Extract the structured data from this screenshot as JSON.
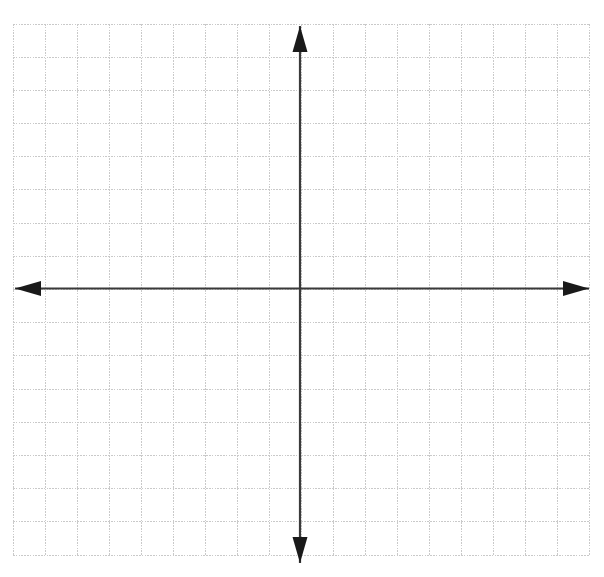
{
  "figure": {
    "name": "blank-cartesian-coordinate-grid",
    "type": "coordinate-plane",
    "background_color": "#ffffff"
  },
  "canvas": {
    "width": 604,
    "height": 577
  },
  "grid": {
    "line_color": "#c9c9c9",
    "line_width": 1,
    "dash_pattern": "1.6 1.2",
    "left": 13,
    "top": 24,
    "right": 590,
    "bottom": 555,
    "columns": 18,
    "rows": 16,
    "cell_width": 32.05,
    "cell_height": 33.19,
    "visible": true
  },
  "axes": {
    "color": "#3a3a3a",
    "line_width": 2.2,
    "origin_x": 300,
    "origin_y": 288.5,
    "x_axis": {
      "name": "x-axis",
      "label": "",
      "start_x": 15,
      "end_x": 589,
      "arrow_both_ends": true
    },
    "y_axis": {
      "name": "y-axis",
      "label": "",
      "start_y": 26,
      "end_y": 563,
      "arrow_both_ends": true
    },
    "tick_labels": [],
    "axis_labels": []
  },
  "arrowheads": {
    "color": "#1a1a1a",
    "length": 26,
    "half_width": 7.5,
    "left": {
      "name": "x-axis-left-arrowhead",
      "tip_x": 15,
      "tip_y": 288.5
    },
    "right": {
      "name": "x-axis-right-arrowhead",
      "tip_x": 589,
      "tip_y": 288.5
    },
    "up": {
      "name": "y-axis-up-arrowhead",
      "tip_x": 300,
      "tip_y": 26
    },
    "down": {
      "name": "y-axis-down-arrowhead",
      "tip_x": 300,
      "tip_y": 563
    }
  },
  "chart_data": {
    "type": "scatter",
    "title": "",
    "subtitle": "",
    "xlabel": "",
    "ylabel": "",
    "series": [],
    "x": [],
    "categories": [],
    "values": [],
    "annotations": [],
    "legend": {
      "entries": [],
      "position": "none"
    },
    "grid": true,
    "xlim": [
      -8.95,
      9.05
    ],
    "ylim": [
      -8,
      8
    ],
    "xticks": [
      -8,
      -7,
      -6,
      -5,
      -4,
      -3,
      -2,
      -1,
      0,
      1,
      2,
      3,
      4,
      5,
      6,
      7,
      8,
      9
    ],
    "yticks": [
      -8,
      -7,
      -6,
      -5,
      -4,
      -3,
      -2,
      -1,
      0,
      1,
      2,
      3,
      4,
      5,
      6,
      7,
      8
    ],
    "xtick_labels": [],
    "ytick_labels": []
  }
}
